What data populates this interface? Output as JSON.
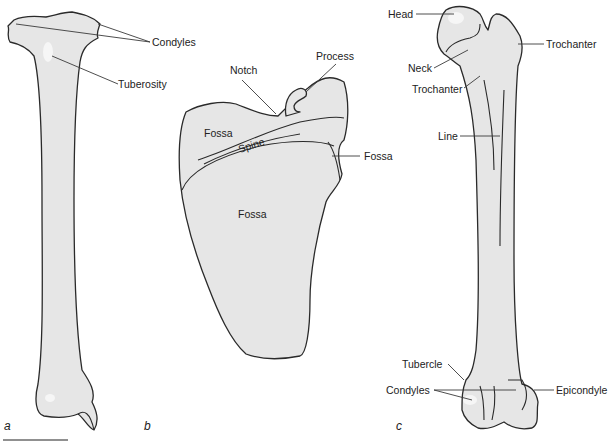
{
  "figure": {
    "panels": [
      {
        "id": "a",
        "label": "a",
        "bone": "tibia",
        "annotations": [
          {
            "text": "Condyles"
          },
          {
            "text": "Tuberosity"
          }
        ]
      },
      {
        "id": "b",
        "label": "b",
        "bone": "scapula",
        "annotations": [
          {
            "text": "Notch"
          },
          {
            "text": "Process"
          },
          {
            "text": "Fossa"
          },
          {
            "text": "Spine"
          },
          {
            "text": "Fossa"
          },
          {
            "text": "Fossa"
          }
        ]
      },
      {
        "id": "c",
        "label": "c",
        "bone": "femur",
        "annotations": [
          {
            "text": "Head"
          },
          {
            "text": "Trochanter"
          },
          {
            "text": "Neck"
          },
          {
            "text": "Trochanter"
          },
          {
            "text": "Line"
          },
          {
            "text": "Tubercle"
          },
          {
            "text": "Condyles"
          },
          {
            "text": "Epicondyle"
          }
        ]
      }
    ],
    "scale_bar": {
      "visible": true
    },
    "colors": {
      "bone_fill": "#e6e6e6",
      "outline": "#2a2a2a",
      "text": "#222222",
      "background": "#ffffff"
    }
  }
}
